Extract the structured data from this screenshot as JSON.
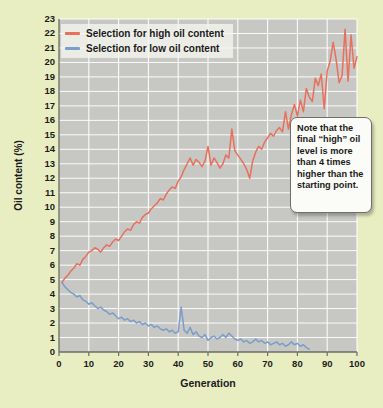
{
  "chart_data": {
    "type": "line",
    "title": "",
    "xlabel": "Generation",
    "ylabel": "Oil content (%)",
    "xlim": [
      0,
      100
    ],
    "ylim": [
      0,
      23
    ],
    "xticks": [
      0,
      10,
      20,
      30,
      40,
      50,
      60,
      70,
      80,
      90,
      100
    ],
    "yticks": [
      0,
      1,
      2,
      3,
      4,
      5,
      6,
      7,
      8,
      9,
      10,
      11,
      12,
      13,
      14,
      15,
      16,
      17,
      18,
      19,
      20,
      21,
      22,
      23
    ],
    "grid": true,
    "plot_background": "#c7c7c4",
    "grid_color": "#ffffff",
    "page_background": "#e9eec2",
    "legend_position": "top-left",
    "annotations": [
      {
        "name": "callout",
        "text": "Note that the final “high” oil level is more than 4 times higher than the starting point."
      }
    ],
    "series": [
      {
        "name": "Selection for high oil content",
        "color": "#e8705c",
        "x": [
          1,
          2,
          3,
          4,
          5,
          6,
          7,
          8,
          9,
          10,
          11,
          12,
          13,
          14,
          15,
          16,
          17,
          18,
          19,
          20,
          21,
          22,
          23,
          24,
          25,
          26,
          27,
          28,
          29,
          30,
          31,
          32,
          33,
          34,
          35,
          36,
          37,
          38,
          39,
          40,
          41,
          42,
          43,
          44,
          45,
          46,
          47,
          48,
          49,
          50,
          51,
          52,
          53,
          54,
          55,
          56,
          57,
          58,
          59,
          60,
          61,
          62,
          63,
          64,
          65,
          66,
          67,
          68,
          69,
          70,
          71,
          72,
          73,
          74,
          75,
          76,
          77,
          78,
          79,
          80,
          81,
          82,
          83,
          84,
          85,
          86,
          87,
          88,
          89,
          90,
          91,
          92,
          93,
          94,
          95,
          96,
          97,
          98,
          99,
          100
        ],
        "values": [
          4.8,
          5.1,
          5.3,
          5.6,
          5.8,
          6.1,
          6.0,
          6.4,
          6.6,
          6.9,
          7.0,
          7.2,
          7.1,
          6.9,
          7.2,
          7.4,
          7.3,
          7.6,
          7.8,
          7.7,
          8.0,
          8.3,
          8.5,
          8.4,
          8.8,
          9.0,
          8.9,
          9.3,
          9.5,
          9.6,
          9.9,
          10.1,
          10.3,
          10.6,
          10.5,
          10.9,
          11.2,
          11.4,
          11.3,
          11.8,
          12.1,
          12.6,
          13.0,
          13.4,
          12.9,
          13.3,
          13.1,
          12.8,
          13.2,
          14.2,
          12.9,
          13.4,
          13.1,
          12.7,
          13.0,
          13.6,
          13.4,
          15.4,
          13.9,
          13.6,
          13.3,
          13.0,
          12.6,
          12.0,
          13.2,
          13.8,
          14.2,
          14.0,
          14.5,
          14.8,
          15.1,
          14.9,
          15.3,
          15.5,
          15.2,
          16.6,
          15.4,
          16.4,
          17.1,
          16.3,
          17.4,
          16.6,
          18.2,
          17.6,
          17.3,
          18.9,
          18.4,
          19.2,
          16.8,
          19.4,
          20.1,
          21.4,
          20.2,
          18.6,
          19.1,
          22.3,
          18.7,
          21.9,
          19.6,
          20.4
        ]
      },
      {
        "name": "Selection for low oil content",
        "color": "#7b9dc9",
        "x": [
          1,
          2,
          3,
          4,
          5,
          6,
          7,
          8,
          9,
          10,
          11,
          12,
          13,
          14,
          15,
          16,
          17,
          18,
          19,
          20,
          21,
          22,
          23,
          24,
          25,
          26,
          27,
          28,
          29,
          30,
          31,
          32,
          33,
          34,
          35,
          36,
          37,
          38,
          39,
          40,
          41,
          42,
          43,
          44,
          45,
          46,
          47,
          48,
          49,
          50,
          51,
          52,
          53,
          54,
          55,
          56,
          57,
          58,
          59,
          60,
          61,
          62,
          63,
          64,
          65,
          66,
          67,
          68,
          69,
          70,
          71,
          72,
          73,
          74,
          75,
          76,
          77,
          78,
          79,
          80,
          81,
          82,
          83,
          84
        ],
        "values": [
          4.8,
          4.5,
          4.3,
          4.1,
          4.0,
          3.8,
          3.9,
          3.6,
          3.5,
          3.3,
          3.4,
          3.2,
          3.0,
          3.1,
          2.9,
          2.8,
          2.6,
          2.7,
          2.5,
          2.3,
          2.4,
          2.2,
          2.3,
          2.1,
          2.2,
          2.0,
          2.1,
          1.9,
          2.0,
          1.8,
          1.9,
          1.7,
          1.8,
          1.6,
          1.5,
          1.6,
          1.4,
          1.5,
          1.3,
          1.4,
          3.1,
          1.5,
          1.3,
          1.7,
          1.2,
          1.4,
          1.1,
          1.0,
          1.2,
          0.8,
          1.0,
          1.1,
          0.9,
          1.0,
          1.2,
          1.0,
          1.3,
          1.1,
          0.9,
          0.8,
          0.9,
          0.7,
          0.8,
          0.6,
          0.7,
          0.9,
          0.7,
          0.8,
          0.6,
          0.7,
          0.5,
          0.6,
          0.7,
          0.5,
          0.6,
          0.4,
          0.5,
          0.7,
          0.5,
          0.6,
          0.4,
          0.5,
          0.3,
          0.2
        ]
      }
    ]
  }
}
